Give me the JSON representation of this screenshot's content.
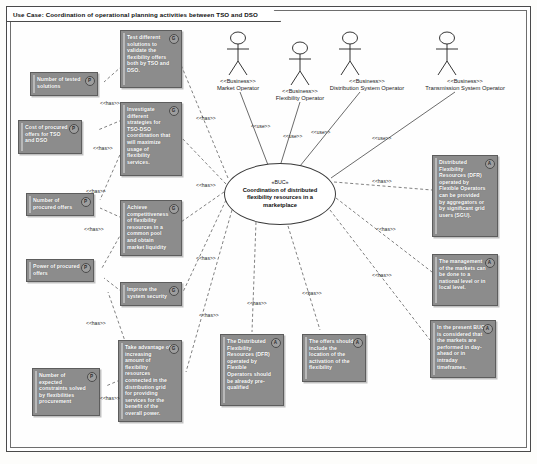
{
  "frame": {
    "title": "Use Case: Coordination of operational planning activities between TSO and DSO"
  },
  "usecase": {
    "stereotype": "«BUC»",
    "name": "Coordination of distributed flexibility resources in a marketplace"
  },
  "actors": [
    {
      "stereotype": "<<Business>>",
      "name": "Market Operator"
    },
    {
      "stereotype": "<<Business>>",
      "name": "Flexibility Operator"
    },
    {
      "stereotype": "<<Business>>",
      "name": "Distribution System Operator"
    },
    {
      "stereotype": "<<Business>>",
      "name": "Transmission System Operator"
    }
  ],
  "edge_labels": {
    "use": "<<use>>",
    "has": "<<has>>"
  },
  "notes": [
    {
      "id": "test-solutions",
      "badge": "G",
      "text": "Test different solutions to validate the flexibility offers both by TSO and DSO."
    },
    {
      "id": "number-tested-solutions",
      "badge": "P",
      "text": "Number of tested solutions"
    },
    {
      "id": "investigate-strategies",
      "badge": "G",
      "text": "Investigate different strategies for TSO-DSO coordination that will maximize usage of flexibility services."
    },
    {
      "id": "cost-procured-offers",
      "badge": "P",
      "text": "Cost of procured offers for TSO and DSO"
    },
    {
      "id": "number-procured-offers",
      "badge": "P",
      "text": "Number of procured offers"
    },
    {
      "id": "achieve-competitiveness",
      "badge": "G",
      "text": "Achieve competitiveness of flexibility resources in a common pool and obtain market liquidity"
    },
    {
      "id": "power-procured-offers",
      "badge": "P",
      "text": "Power of procured offers"
    },
    {
      "id": "improve-system-security",
      "badge": "G",
      "text": "Improve the system security"
    },
    {
      "id": "number-expected-constraints",
      "badge": "P",
      "text": "Number of expected constraints solved by flexibilities procurement"
    },
    {
      "id": "take-advantage-flexibility",
      "badge": "G",
      "text": "Take advantage of increasing amount of flexibility resources connected in the distribution grid for providing services for the benefit of the overall power."
    },
    {
      "id": "dfr-pre-qualified",
      "badge": "A",
      "text": "The Distributed Flexibility Resources (DFR) operated by Flexible Operators should be already pre-qualified"
    },
    {
      "id": "offers-include-location",
      "badge": "A",
      "text": "The offers should include the location of the activation of the flexibility"
    },
    {
      "id": "dfr-aggregators-sgu",
      "badge": "A",
      "text": "Distributed Flexibility Resources (DFR) operated by Flexible Operators can be provided by aggregators or by significant grid users (SGU)."
    },
    {
      "id": "market-management-level",
      "badge": "A",
      "text": "The management of the markets can be done to a national level or in local level."
    },
    {
      "id": "timeframes",
      "badge": "A",
      "text": "In the present BUC is considered that the markets are performed in day-ahead or in intraday timeframes."
    }
  ]
}
